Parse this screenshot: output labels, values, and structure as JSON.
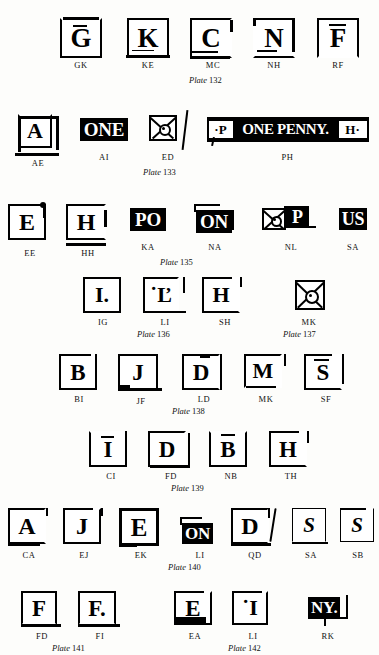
{
  "page": {
    "background_color": "#fdfdfb",
    "ink_color": "#000000"
  },
  "rows": [
    {
      "id": "row-1",
      "plate_label": {
        "italic": "Plate",
        "number": "132"
      },
      "items": [
        {
          "code": "GK",
          "glyph": "G",
          "style": "boxed-letter"
        },
        {
          "code": "KE",
          "glyph": "K",
          "style": "boxed-letter"
        },
        {
          "code": "MC",
          "glyph": "C",
          "style": "boxed-letter"
        },
        {
          "code": "NH",
          "glyph": "N",
          "style": "boxed-letter"
        },
        {
          "code": "RF",
          "glyph": "F",
          "style": "boxed-letter"
        }
      ]
    },
    {
      "id": "row-2",
      "plate_label": {
        "italic": "Plate",
        "number": "133"
      },
      "items": [
        {
          "code": "AE",
          "glyph": "A",
          "style": "boxed-letter"
        },
        {
          "code": "AI",
          "glyph": "ONE",
          "style": "inverted-wordmark"
        },
        {
          "code": "ED",
          "glyph": "maltese-cross",
          "style": "cross"
        },
        {
          "code": "PH",
          "glyph": "P ONE PENNY H",
          "style": "penny-bar"
        }
      ]
    },
    {
      "id": "row-3",
      "plate_label": {
        "italic": "Plate",
        "number": "135"
      },
      "items": [
        {
          "code": "EE",
          "glyph": "E",
          "style": "boxed-letter"
        },
        {
          "code": "HH",
          "glyph": "H",
          "style": "boxed-letter"
        },
        {
          "code": "KA",
          "glyph": "PO",
          "style": "inverted-wordmark"
        },
        {
          "code": "NA",
          "glyph": "ON",
          "style": "inverted-wordmark"
        },
        {
          "code": "NL",
          "glyph": "cross-P",
          "style": "cross-letter"
        },
        {
          "code": "SA",
          "glyph": "US",
          "style": "inverted-wordmark"
        }
      ]
    },
    {
      "id": "row-4",
      "plate_labels": [
        {
          "italic": "Plate",
          "number": "136"
        },
        {
          "italic": "Plate",
          "number": "137"
        }
      ],
      "items": [
        {
          "code": "IG",
          "glyph": "I.",
          "style": "boxed-letter"
        },
        {
          "code": "LI",
          "glyph": "L",
          "style": "boxed-letter"
        },
        {
          "code": "SH",
          "glyph": "H",
          "style": "boxed-letter"
        },
        {
          "code": "MK",
          "glyph": "maltese-cross",
          "style": "cross"
        }
      ]
    },
    {
      "id": "row-5",
      "plate_label": {
        "italic": "Plate",
        "number": "138"
      },
      "items": [
        {
          "code": "BI",
          "glyph": "B",
          "style": "boxed-letter"
        },
        {
          "code": "JF",
          "glyph": "J",
          "style": "boxed-letter"
        },
        {
          "code": "LD",
          "glyph": "D",
          "style": "boxed-letter"
        },
        {
          "code": "MK",
          "glyph": "M",
          "style": "boxed-letter"
        },
        {
          "code": "SF",
          "glyph": "S",
          "style": "boxed-letter"
        }
      ]
    },
    {
      "id": "row-6",
      "plate_label": {
        "italic": "Plate",
        "number": "139"
      },
      "items": [
        {
          "code": "CI",
          "glyph": "I",
          "style": "boxed-letter"
        },
        {
          "code": "FD",
          "glyph": "D",
          "style": "boxed-letter"
        },
        {
          "code": "NB",
          "glyph": "B",
          "style": "boxed-letter"
        },
        {
          "code": "TH",
          "glyph": "H",
          "style": "boxed-letter"
        }
      ]
    },
    {
      "id": "row-7",
      "plate_label": {
        "italic": "Plate",
        "number": "140"
      },
      "items": [
        {
          "code": "CA",
          "glyph": "A",
          "style": "boxed-letter"
        },
        {
          "code": "EJ",
          "glyph": "J",
          "style": "boxed-letter"
        },
        {
          "code": "EK",
          "glyph": "E",
          "style": "boxed-letter"
        },
        {
          "code": "LI",
          "glyph": "ON",
          "style": "inverted-wordmark"
        },
        {
          "code": "QD",
          "glyph": "D",
          "style": "boxed-letter"
        },
        {
          "code": "SA",
          "glyph": "S",
          "style": "boxed-letter"
        },
        {
          "code": "SB",
          "glyph": "S",
          "style": "boxed-letter"
        }
      ]
    },
    {
      "id": "row-8",
      "plate_labels": [
        {
          "italic": "Plate",
          "number": "141"
        },
        {
          "italic": "Plate",
          "number": "142"
        }
      ],
      "items": [
        {
          "code": "FD",
          "glyph": "F",
          "style": "boxed-letter"
        },
        {
          "code": "FI",
          "glyph": "F.",
          "style": "boxed-letter"
        },
        {
          "code": "EA",
          "glyph": "E",
          "style": "boxed-letter"
        },
        {
          "code": "LI",
          "glyph": "I",
          "style": "boxed-letter"
        },
        {
          "code": "RK",
          "glyph": "NY.",
          "style": "inverted-wordmark"
        }
      ]
    }
  ]
}
